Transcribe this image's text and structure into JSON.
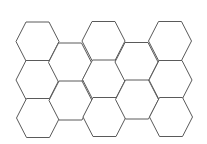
{
  "diagram": {
    "type": "hexagon-grid",
    "orientation": "flat-top",
    "columns": 5,
    "stroke_color": "#5a5a5a",
    "fill_color": "#ffffff",
    "background": "#ffffff",
    "hex_geometry": {
      "half_width": 21.5,
      "top_edge_half": 11.5,
      "half_height": 19.5
    },
    "hexagons": [
      {
        "col": 0,
        "row": 0,
        "cx": 37.5,
        "cy": 41.5
      },
      {
        "col": 0,
        "row": 1,
        "cx": 37.5,
        "cy": 80
      },
      {
        "col": 0,
        "row": 2,
        "cx": 38,
        "cy": 118
      },
      {
        "col": 1,
        "row": 0,
        "cx": 70,
        "cy": 62.5
      },
      {
        "col": 1,
        "row": 1,
        "cx": 70.5,
        "cy": 100.5
      },
      {
        "col": 2,
        "row": 0,
        "cx": 103.5,
        "cy": 41
      },
      {
        "col": 2,
        "row": 1,
        "cx": 104,
        "cy": 79.5
      },
      {
        "col": 2,
        "row": 2,
        "cx": 104.5,
        "cy": 117
      },
      {
        "col": 3,
        "row": 0,
        "cx": 136.5,
        "cy": 62
      },
      {
        "col": 3,
        "row": 1,
        "cx": 137,
        "cy": 99.5
      },
      {
        "col": 4,
        "row": 0,
        "cx": 170,
        "cy": 41
      },
      {
        "col": 4,
        "row": 1,
        "cx": 170.5,
        "cy": 80
      },
      {
        "col": 4,
        "row": 2,
        "cx": 171,
        "cy": 117
      }
    ]
  }
}
